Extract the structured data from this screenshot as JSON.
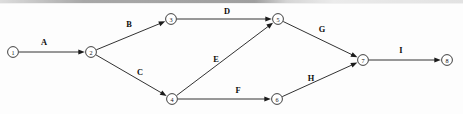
{
  "diagram": {
    "type": "directed-graph",
    "canvas": {
      "width": 463,
      "height": 114
    },
    "style": {
      "background_color": "#fdfdfd",
      "line_color": "#1b1b1b",
      "node_fill": "#ffffff",
      "node_stroke": "#2a2a2a",
      "label_color": "#0d0d0d",
      "node_radius": 5.4,
      "arrow_length": 6.5,
      "arrow_width": 2.6
    },
    "nodes": [
      {
        "id": "n1",
        "label": "①",
        "number": "1",
        "x": 13,
        "y": 52
      },
      {
        "id": "n2",
        "label": "②",
        "number": "2",
        "x": 91,
        "y": 52
      },
      {
        "id": "n3",
        "label": "③",
        "number": "3",
        "x": 171,
        "y": 19
      },
      {
        "id": "n4",
        "label": "④",
        "number": "4",
        "x": 172,
        "y": 99
      },
      {
        "id": "n5",
        "label": "⑤",
        "number": "5",
        "x": 278,
        "y": 19
      },
      {
        "id": "n6",
        "label": "⑥",
        "number": "6",
        "x": 277,
        "y": 99
      },
      {
        "id": "n7",
        "label": "⑦",
        "number": "7",
        "x": 363,
        "y": 60
      },
      {
        "id": "n8",
        "label": "⑧",
        "number": "8",
        "x": 447,
        "y": 60
      }
    ],
    "edges": [
      {
        "id": "e-a",
        "label": "A",
        "from": "n1",
        "to": "n2",
        "label_x": 44,
        "label_y": 42
      },
      {
        "id": "e-b",
        "label": "B",
        "from": "n2",
        "to": "n3",
        "label_x": 129,
        "label_y": 24
      },
      {
        "id": "e-c",
        "label": "C",
        "from": "n2",
        "to": "n4",
        "label_x": 140,
        "label_y": 72
      },
      {
        "id": "e-d",
        "label": "D",
        "from": "n3",
        "to": "n5",
        "label_x": 227,
        "label_y": 11
      },
      {
        "id": "e-e",
        "label": "E",
        "from": "n4",
        "to": "n5",
        "label_x": 216,
        "label_y": 59
      },
      {
        "id": "e-f",
        "label": "F",
        "from": "n4",
        "to": "n6",
        "label_x": 238,
        "label_y": 90
      },
      {
        "id": "e-g",
        "label": "G",
        "from": "n5",
        "to": "n7",
        "label_x": 322,
        "label_y": 29
      },
      {
        "id": "e-h",
        "label": "H",
        "from": "n6",
        "to": "n7",
        "label_x": 311,
        "label_y": 78
      },
      {
        "id": "e-i",
        "label": "I",
        "from": "n7",
        "to": "n8",
        "label_x": 401,
        "label_y": 50
      }
    ]
  }
}
